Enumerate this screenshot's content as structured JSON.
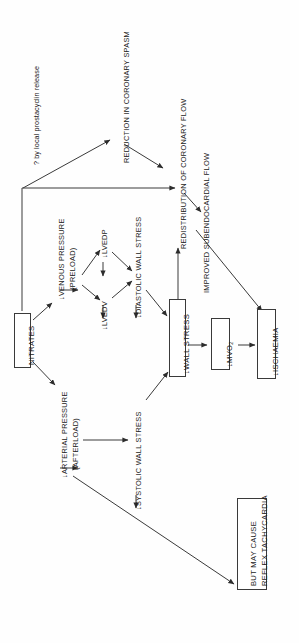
{
  "diagram": {
    "orientation": "rotated-90-ccw",
    "canvas": {
      "width": 299,
      "height": 643
    },
    "nodes": {
      "nitrates": {
        "label": "NITRATES",
        "boxed": true
      },
      "venous_pressure": {
        "label": "↓VENOUS PRESSURE",
        "label2": "(PRELOAD)",
        "boxed": false
      },
      "arterial_pressure": {
        "label": "↓ARTERIAL PRESSURE",
        "label2": "(AFTERLOAD)",
        "boxed": false
      },
      "lvedp": {
        "label": "↓LVEDP",
        "boxed": false
      },
      "lvedv": {
        "label": "↓LVEDV",
        "boxed": false
      },
      "diastolic_wall": {
        "label": "↓DIASTOLIC WALL STRESS",
        "boxed": false
      },
      "systolic_wall": {
        "label": "↓SYSTOLIC WALL STRESS",
        "boxed": false
      },
      "wall_stress": {
        "label": "↓WALL STRESS",
        "boxed": true
      },
      "mvo2": {
        "label": "↓MVO",
        "sub": "2",
        "boxed": true
      },
      "ischaemia": {
        "label": "↓ISCHAEMIA",
        "boxed": true
      },
      "coronary_spasm": {
        "label": "REDUCTION IN CORONARY SPASM",
        "boxed": false
      },
      "coronary_flow": {
        "label": "REDISTRIBUTION OF CORONARY FLOW",
        "boxed": false
      },
      "subendo_flow": {
        "label": "IMPROVED SUBENDOCARDIAL FLOW",
        "boxed": false
      },
      "tachycardia": {
        "label": "BUT MAY CAUSE",
        "label2": "REFLEX TACHYCARDIA",
        "boxed": true
      }
    },
    "annotations": {
      "prostacyclin": {
        "line1": "? by local prostacyclin",
        "line2": "release"
      }
    },
    "edges": [
      {
        "from": "nitrates",
        "to": "venous_pressure"
      },
      {
        "from": "nitrates",
        "to": "arterial_pressure"
      },
      {
        "from": "nitrates",
        "to": "coronary_spasm"
      },
      {
        "from": "nitrates",
        "to": "coronary_flow"
      },
      {
        "from": "venous_pressure",
        "to": "lvedp"
      },
      {
        "from": "venous_pressure",
        "to": "lvedv"
      },
      {
        "from": "lvedp",
        "to": "diastolic_wall"
      },
      {
        "from": "lvedv",
        "to": "diastolic_wall"
      },
      {
        "from": "diastolic_wall",
        "to": "wall_stress"
      },
      {
        "from": "arterial_pressure",
        "to": "systolic_wall"
      },
      {
        "from": "systolic_wall",
        "to": "wall_stress"
      },
      {
        "from": "wall_stress",
        "to": "mvo2"
      },
      {
        "from": "mvo2",
        "to": "ischaemia"
      },
      {
        "from": "wall_stress",
        "to": "coronary_flow"
      },
      {
        "from": "coronary_spasm",
        "to": "coronary_flow"
      },
      {
        "from": "coronary_flow",
        "to": "subendo_flow"
      },
      {
        "from": "subendo_flow",
        "to": "ischaemia"
      },
      {
        "from": "arterial_pressure",
        "to": "tachycardia"
      }
    ],
    "colors": {
      "stroke": "#3a3a3a",
      "text": "#1a1a1a",
      "background": "#ffffff"
    }
  }
}
